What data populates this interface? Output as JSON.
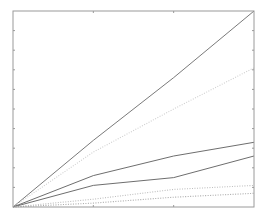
{
  "chart_data": {
    "type": "line",
    "title": "",
    "xlabel": "",
    "ylabel": "",
    "xlim": [
      0,
      3
    ],
    "ylim": [
      0,
      10
    ],
    "x_ticks": [
      0,
      1,
      2,
      3
    ],
    "y_ticks": [
      0,
      1,
      2,
      3,
      4,
      5,
      6,
      7,
      8,
      9,
      10
    ],
    "tick_labels_visible": false,
    "grid": false,
    "legend": "none",
    "x": [
      0,
      1,
      2,
      3
    ],
    "series": [
      {
        "name": "series-1",
        "style": "solid",
        "color": "#7a7a7a",
        "values": [
          0,
          3.4,
          6.6,
          10.0
        ]
      },
      {
        "name": "series-2",
        "style": "dotted",
        "color": "#cfcfcf",
        "values": [
          0,
          2.8,
          5.0,
          7.1
        ]
      },
      {
        "name": "series-3",
        "style": "solid",
        "color": "#6e6e6e",
        "values": [
          0,
          1.6,
          2.6,
          3.3
        ]
      },
      {
        "name": "series-4",
        "style": "solid",
        "color": "#6e6e6e",
        "values": [
          0,
          1.1,
          1.5,
          2.6
        ]
      },
      {
        "name": "series-5",
        "style": "dotted",
        "color": "#bdbdbd",
        "values": [
          0,
          0.4,
          0.9,
          1.1
        ]
      },
      {
        "name": "series-6",
        "style": "dotted",
        "color": "#a8a8a8",
        "values": [
          0,
          0.2,
          0.5,
          0.7
        ]
      }
    ],
    "axis_color": "#9a9a9a"
  }
}
